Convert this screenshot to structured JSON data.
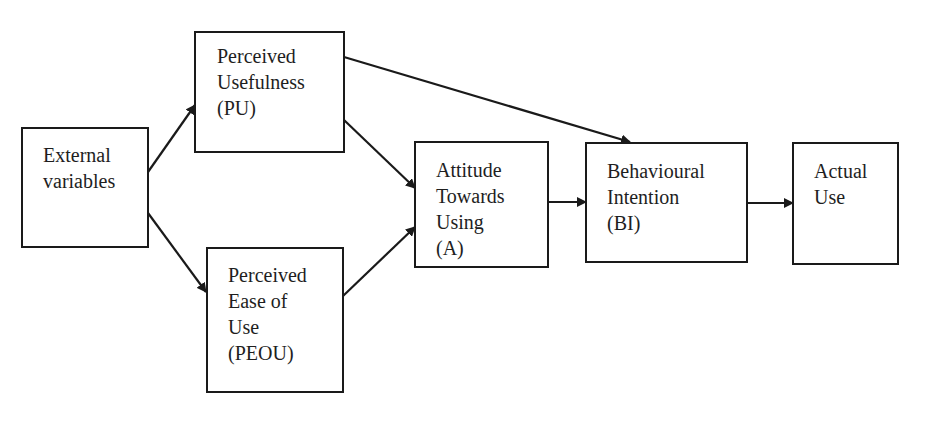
{
  "diagram": {
    "nodes": [
      {
        "id": "external",
        "label": "External\nvariables"
      },
      {
        "id": "pu",
        "label": "Perceived\nUsefulness\n(PU)"
      },
      {
        "id": "peou",
        "label": "Perceived\nEase of\nUse\n(PEOU)"
      },
      {
        "id": "attitude",
        "label": "Attitude\nTowards\nUsing\n(A)"
      },
      {
        "id": "bi",
        "label": "Behavioural\nIntention\n(BI)"
      },
      {
        "id": "actual",
        "label": "Actual\nUse"
      }
    ],
    "edges": [
      {
        "from": "external",
        "to": "pu"
      },
      {
        "from": "external",
        "to": "peou"
      },
      {
        "from": "pu",
        "to": "attitude"
      },
      {
        "from": "peou",
        "to": "attitude"
      },
      {
        "from": "pu",
        "to": "bi"
      },
      {
        "from": "attitude",
        "to": "bi"
      },
      {
        "from": "bi",
        "to": "actual"
      }
    ],
    "colors": {
      "stroke": "#1a1a1a",
      "background": "#ffffff",
      "text": "#1e1e1e"
    }
  }
}
